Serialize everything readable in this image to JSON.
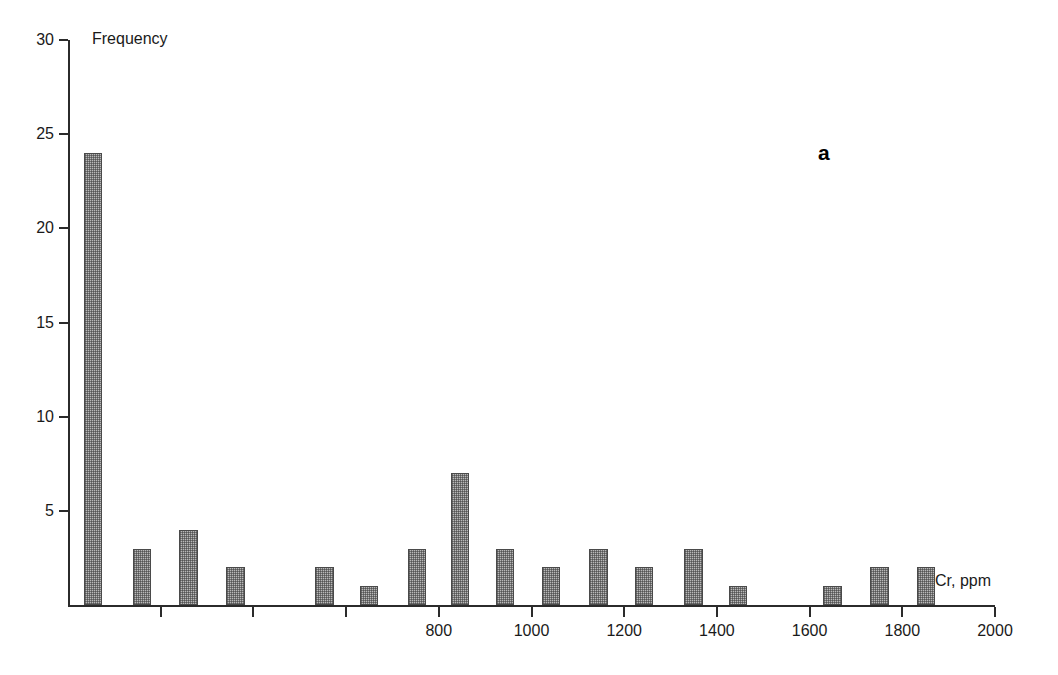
{
  "figure": {
    "panel_label": "a",
    "background_color": "#ffffff",
    "bar_fill_color": "#b9b9b9",
    "bar_border_color": "#4a4a4a",
    "axis_color": "#2b2b2b"
  },
  "chart_data": {
    "type": "bar",
    "title": "",
    "subtitle": "",
    "xlabel": "Cr, ppm",
    "ylabel": "Frequency",
    "xlim": [
      0,
      2000
    ],
    "ylim": [
      0,
      30
    ],
    "grid": false,
    "legend": null,
    "annotations": [
      {
        "text": "a",
        "x": 1635,
        "y": 26
      }
    ],
    "x_ticks": [
      0,
      200,
      400,
      600,
      800,
      1000,
      1200,
      1400,
      1600,
      1800,
      2000
    ],
    "x_tick_labels": [
      "",
      "",
      "",
      "",
      "800",
      "1000",
      "1200",
      "1400",
      "1600",
      "1800",
      "2000"
    ],
    "y_ticks": [
      0,
      5,
      10,
      15,
      20,
      25,
      30
    ],
    "y_tick_labels": [
      "",
      "5",
      "10",
      "15",
      "20",
      "25",
      "30"
    ],
    "bar_width_ppm": 40,
    "x": [
      54,
      160,
      260,
      361,
      553,
      649,
      753,
      846,
      943,
      1042,
      1144,
      1243,
      1349,
      1446,
      1649,
      1751,
      1851
    ],
    "values": [
      24,
      3,
      4,
      2,
      2,
      1,
      3,
      7,
      3,
      2,
      3,
      2,
      3,
      1,
      1,
      2,
      2
    ],
    "categories": [
      "54",
      "160",
      "260",
      "361",
      "553",
      "649",
      "753",
      "846",
      "943",
      "1042",
      "1144",
      "1243",
      "1349",
      "1446",
      "1649",
      "1751",
      "1851"
    ],
    "series": [
      {
        "name": "Frequency",
        "values": [
          24,
          3,
          4,
          2,
          2,
          1,
          3,
          7,
          3,
          2,
          3,
          2,
          3,
          1,
          1,
          2,
          2
        ]
      }
    ]
  }
}
